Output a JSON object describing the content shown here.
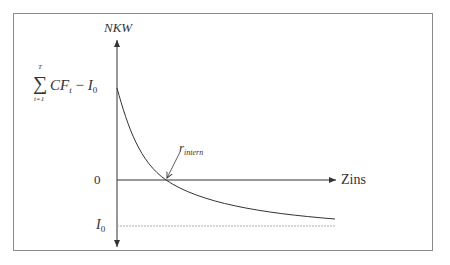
{
  "diagram": {
    "y_axis_label": "NKW",
    "x_axis_label": "Zins",
    "y_ticks": {
      "top": {
        "sum_symbol": "∑",
        "sum_upper": "T",
        "sum_lower": "t=1",
        "cf": "CF",
        "cf_sub": "t",
        "minus": " − ",
        "i": "I",
        "i_sub": "0"
      },
      "zero": "0",
      "bottom": {
        "i": "I",
        "i_sub": "0"
      }
    },
    "annotation": {
      "r": "r",
      "r_sub": "intern"
    },
    "colors": {
      "axis": "#333333",
      "curve": "#333333",
      "dotted_line": "#999999",
      "frame": "#8a8a8a"
    },
    "curve_description": "Decreasing convex NPV curve crossing zero at internal rate of return, asymptotically approaching -I0"
  }
}
